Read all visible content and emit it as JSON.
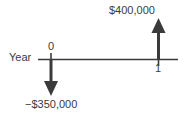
{
  "diagram": {
    "type": "cash-flow-timeline",
    "axis": {
      "title": "Year",
      "line_color": "#3b3b3b",
      "ticks": [
        {
          "label": "0",
          "position": "above-line"
        },
        {
          "label": "1",
          "position": "below-line"
        }
      ]
    },
    "cash_flows": [
      {
        "period": "0",
        "label": "−$350,000",
        "amount": -350000,
        "direction": "outflow",
        "arrow": "down-arrow"
      },
      {
        "period": "1",
        "label": "$400,000",
        "amount": 400000,
        "direction": "inflow",
        "arrow": "up-arrow"
      }
    ],
    "colors": {
      "stroke": "#3b3b3b",
      "text": "#3b3b3b",
      "background": "#ffffff"
    }
  }
}
